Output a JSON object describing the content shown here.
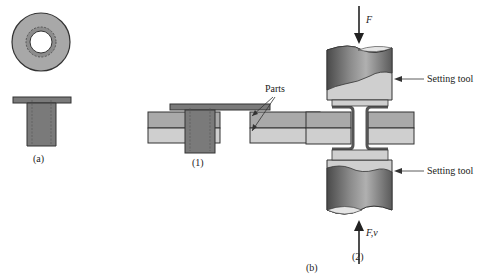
{
  "figure": {
    "panel_a": {
      "label": "(a)"
    },
    "panel_b": {
      "label": "(b)",
      "step1": {
        "label": "(1)",
        "callout": "Parts"
      },
      "step2": {
        "label": "(2)",
        "top_force": "F",
        "bottom_force": "F,v",
        "top_tool": "Setting tool",
        "bottom_tool": "Setting tool"
      }
    }
  },
  "colors": {
    "rivet": "#7a7a7a",
    "plate_top": "#a9a9a9",
    "plate_bottom": "#c9c9c9",
    "tool_light": "#cfcfcf",
    "tool_dark": "#555555",
    "outline": "#333333"
  }
}
